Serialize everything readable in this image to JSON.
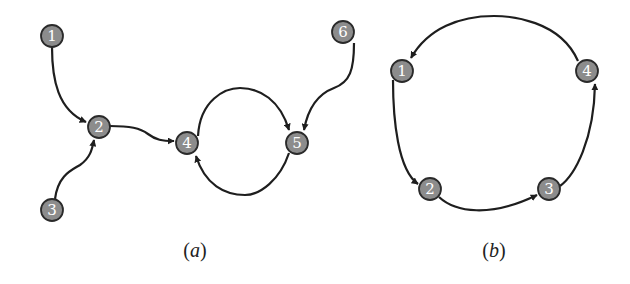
{
  "diagrams": [
    {
      "id": "a",
      "caption": "(a)",
      "caption_letter": "a",
      "nodes": [
        {
          "label": "1",
          "x": 52,
          "y": 36
        },
        {
          "label": "2",
          "x": 99,
          "y": 127
        },
        {
          "label": "3",
          "x": 52,
          "y": 210
        },
        {
          "label": "4",
          "x": 187,
          "y": 143
        },
        {
          "label": "5",
          "x": 297,
          "y": 143
        },
        {
          "label": "6",
          "x": 343,
          "y": 32
        }
      ],
      "edges": [
        {
          "from": "1",
          "to": "2"
        },
        {
          "from": "3",
          "to": "2"
        },
        {
          "from": "2",
          "to": "4"
        },
        {
          "from": "4",
          "to": "5"
        },
        {
          "from": "5",
          "to": "4"
        },
        {
          "from": "6",
          "to": "5"
        }
      ]
    },
    {
      "id": "b",
      "caption": "(b)",
      "caption_letter": "b",
      "nodes": [
        {
          "label": "1",
          "x": 402,
          "y": 71
        },
        {
          "label": "2",
          "x": 430,
          "y": 189
        },
        {
          "label": "3",
          "x": 549,
          "y": 189
        },
        {
          "label": "4",
          "x": 587,
          "y": 71
        }
      ],
      "edges": [
        {
          "from": "1",
          "to": "2"
        },
        {
          "from": "2",
          "to": "3"
        },
        {
          "from": "3",
          "to": "4"
        },
        {
          "from": "4",
          "to": "1"
        }
      ]
    }
  ],
  "colors": {
    "node_fill": "#8c8c8c",
    "node_stroke": "#2a2a2a",
    "edge": "#1e1e1e",
    "label_text": "#ffffff"
  }
}
